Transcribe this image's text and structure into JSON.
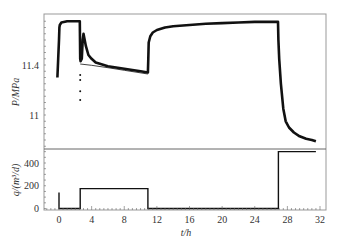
{
  "chart_data": [
    {
      "type": "line",
      "panel": "top",
      "title": "",
      "xlabel": "t/h",
      "ylabel": "P/MPa",
      "ylim": [
        10.72,
        11.81
      ],
      "xlim": [
        -1.8,
        32.5
      ],
      "yticks": [
        11,
        11.4
      ],
      "grid": false,
      "series": [
        {
          "name": "pressure",
          "x": [
            -0.2,
            -0.1,
            0.0,
            0.05,
            0.1,
            0.3,
            1.0,
            2.0,
            2.55,
            2.6,
            2.65,
            2.8,
            2.9,
            3.0,
            3.3,
            3.6,
            4.0,
            4.5,
            5.0,
            6.0,
            7.0,
            8.0,
            9.0,
            10.0,
            10.9,
            10.95,
            11.0,
            11.2,
            11.5,
            12.0,
            13.0,
            14.0,
            16.0,
            18.0,
            20.0,
            22.0,
            24.0,
            26.0,
            26.85,
            26.9,
            27.0,
            27.2,
            27.5,
            27.8,
            28.2,
            28.8,
            29.5,
            30.3,
            31.0,
            31.5
          ],
          "values": [
            11.3,
            11.45,
            11.6,
            11.7,
            11.72,
            11.74,
            11.75,
            11.75,
            11.75,
            11.45,
            11.43,
            11.45,
            11.6,
            11.65,
            11.55,
            11.48,
            11.45,
            11.42,
            11.41,
            11.39,
            11.38,
            11.37,
            11.36,
            11.35,
            11.34,
            11.45,
            11.58,
            11.63,
            11.66,
            11.68,
            11.7,
            11.71,
            11.72,
            11.73,
            11.735,
            11.74,
            11.745,
            11.745,
            11.745,
            11.6,
            11.45,
            11.25,
            11.05,
            10.95,
            10.9,
            10.86,
            10.83,
            10.81,
            10.8,
            10.79
          ]
        },
        {
          "name": "outlier-points",
          "x": [
            2.6,
            2.6,
            2.6,
            2.6
          ],
          "values": [
            11.32,
            11.28,
            11.19,
            11.12
          ]
        }
      ]
    },
    {
      "type": "line",
      "panel": "bottom",
      "title": "",
      "xlabel": "t/h",
      "ylabel": "q/(m³/d)",
      "ylim": [
        0,
        520
      ],
      "xlim": [
        -1.8,
        32.5
      ],
      "xticks": [
        0,
        4,
        8,
        12,
        16,
        20,
        24,
        28,
        32
      ],
      "yticks": [
        0,
        200,
        400
      ],
      "grid": false,
      "series": [
        {
          "name": "rate",
          "x": [
            0,
            0,
            0,
            2.6,
            2.6,
            10.9,
            10.9,
            26.9,
            26.9,
            31.5
          ],
          "values": [
            140,
            0,
            0,
            0,
            175,
            175,
            0,
            0,
            500,
            500
          ]
        }
      ]
    }
  ],
  "labels": {
    "top_ylabel": "P/MPa",
    "bottom_ylabel": "q/(m³/d)",
    "xlabel": "t/h",
    "top_yticks": [
      "11.4",
      "11"
    ],
    "bottom_yticks": [
      "400",
      "200",
      "0"
    ],
    "xticks": [
      "0",
      "4",
      "8",
      "12",
      "16",
      "20",
      "24",
      "28",
      "32"
    ]
  },
  "colors": {
    "line": "#111111",
    "frame": "#999999"
  }
}
